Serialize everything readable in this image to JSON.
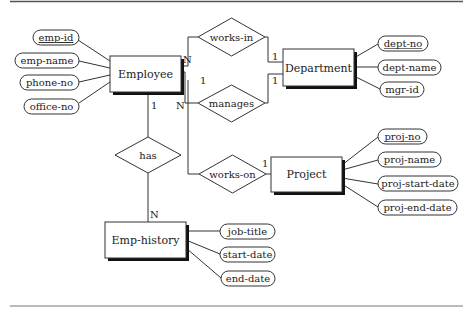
{
  "diagram": {
    "type": "ER diagram",
    "entities": [
      {
        "id": "employee",
        "label": "Employee"
      },
      {
        "id": "department",
        "label": "Department"
      },
      {
        "id": "project",
        "label": "Project"
      },
      {
        "id": "emp_history",
        "label": "Emp-history"
      }
    ],
    "relationships": [
      {
        "id": "works_in",
        "label": "works-in"
      },
      {
        "id": "manages",
        "label": "manages"
      },
      {
        "id": "has",
        "label": "has"
      },
      {
        "id": "works_on",
        "label": "works-on"
      }
    ],
    "attributes": {
      "employee": [
        {
          "label": "emp-id",
          "key": true
        },
        {
          "label": "emp-name",
          "key": false
        },
        {
          "label": "phone-no",
          "key": false
        },
        {
          "label": "office-no",
          "key": false
        }
      ],
      "department": [
        {
          "label": "dept-no",
          "key": true
        },
        {
          "label": "dept-name",
          "key": false
        },
        {
          "label": "mgr-id",
          "key": false
        }
      ],
      "project": [
        {
          "label": "proj-no",
          "key": true
        },
        {
          "label": "proj-name",
          "key": false
        },
        {
          "label": "proj-start-date",
          "key": false
        },
        {
          "label": "proj-end-date",
          "key": false
        }
      ],
      "emp_history": [
        {
          "label": "job-title",
          "key": false
        },
        {
          "label": "start-date",
          "key": false
        },
        {
          "label": "end-date",
          "key": false
        }
      ]
    },
    "cardinalities": {
      "employee_works_in": "N",
      "department_works_in": "1",
      "employee_manages": "1",
      "department_manages": "1",
      "employee_has": "1",
      "emp_history_has": "N",
      "employee_works_on": "N",
      "project_works_on": "1"
    }
  }
}
